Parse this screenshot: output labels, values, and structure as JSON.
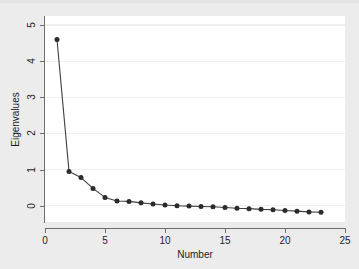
{
  "chart_data": {
    "type": "line",
    "title": "",
    "xlabel": "Number",
    "ylabel": "Eigenvalues",
    "xlim": [
      0,
      25
    ],
    "ylim": [
      -0.45,
      5.25
    ],
    "grid": true,
    "legend": null,
    "marker": "filled-circle",
    "x": [
      1,
      2,
      3,
      4,
      5,
      6,
      7,
      8,
      9,
      10,
      11,
      12,
      13,
      14,
      15,
      16,
      17,
      18,
      19,
      20,
      21,
      22,
      23
    ],
    "values": [
      4.6,
      0.95,
      0.78,
      0.48,
      0.23,
      0.13,
      0.12,
      0.08,
      0.05,
      0.02,
      0.0,
      -0.01,
      -0.02,
      -0.03,
      -0.05,
      -0.07,
      -0.08,
      -0.1,
      -0.11,
      -0.13,
      -0.15,
      -0.17,
      -0.18
    ],
    "xticks": [
      0,
      5,
      10,
      15,
      20,
      25
    ],
    "xtick_labels": [
      "0",
      "5",
      "10",
      "15",
      "20",
      "25"
    ],
    "yticks": [
      0,
      1,
      2,
      3,
      4,
      5
    ],
    "ytick_labels": [
      "0",
      "1",
      "2",
      "3",
      "4",
      "5"
    ],
    "colors": {
      "line": "#3f3f41",
      "marker": "#2b2b2d",
      "plot_background": "#ffffff",
      "figure_background": "#ececed",
      "gridline": "#f0f0f1",
      "axis": "#6d6e70",
      "text": "#1c1c1c"
    }
  }
}
